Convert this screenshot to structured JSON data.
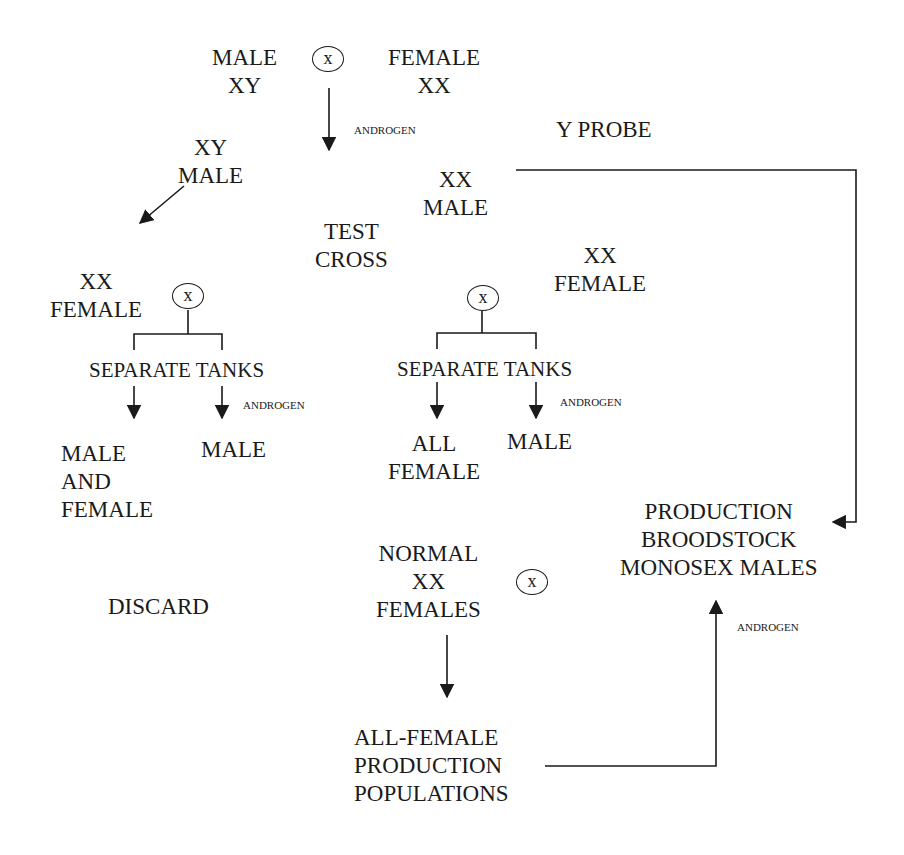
{
  "diagram": {
    "type": "flowchart",
    "nodes": {
      "parent_male": {
        "lines": [
          "MALE",
          "XY"
        ]
      },
      "parent_female": {
        "lines": [
          "FEMALE",
          "XX"
        ]
      },
      "offspring_xy_male": {
        "lines": [
          "XY",
          "MALE"
        ]
      },
      "offspring_xx_male": {
        "lines": [
          "XX",
          "MALE"
        ]
      },
      "test_cross": {
        "lines": [
          "TEST",
          "CROSS"
        ]
      },
      "left_xx_female": {
        "lines": [
          "XX",
          "FEMALE"
        ]
      },
      "mid_xx_female": {
        "lines": [
          "XX",
          "FEMALE"
        ]
      },
      "left_separate_tanks": {
        "text": "SEPARATE TANKS"
      },
      "mid_separate_tanks": {
        "text": "SEPARATE TANKS"
      },
      "left_result_mixed": {
        "lines": [
          "MALE",
          "AND",
          "FEMALE"
        ]
      },
      "left_result_male": {
        "text": "MALE"
      },
      "mid_result_all_female": {
        "lines": [
          "ALL",
          "FEMALE"
        ]
      },
      "mid_result_male": {
        "text": "MALE"
      },
      "discard": {
        "text": "DISCARD"
      },
      "normal_xx_females": {
        "lines": [
          "NORMAL",
          "XX",
          "FEMALES"
        ]
      },
      "production_broodstock": {
        "lines": [
          "PRODUCTION",
          "BROODSTOCK",
          "MONOSEX  MALES"
        ]
      },
      "all_female_production": {
        "lines": [
          "ALL-FEMALE",
          "PRODUCTION",
          "POPULATIONS"
        ]
      }
    },
    "edge_labels": {
      "androgen_top": "ANDROGEN",
      "androgen_left": "ANDROGEN",
      "androgen_mid": "ANDROGEN",
      "androgen_bottom": "ANDROGEN",
      "y_probe": "Y PROBE"
    },
    "cross_symbol": "x",
    "edges": [
      {
        "from": "parent cross",
        "to": "offspring",
        "label": "ANDROGEN"
      },
      {
        "from": "XY MALE",
        "to": "left test cross"
      },
      {
        "from": "XX MALE",
        "to": "PRODUCTION BROODSTOCK MONOSEX MALES",
        "label": "Y PROBE"
      },
      {
        "from": "left cross",
        "to": "MALE AND FEMALE"
      },
      {
        "from": "left cross",
        "to": "MALE",
        "label": "ANDROGEN"
      },
      {
        "from": "middle cross",
        "to": "ALL FEMALE"
      },
      {
        "from": "middle cross",
        "to": "MALE",
        "label": "ANDROGEN"
      },
      {
        "from": "NORMAL XX FEMALES cross",
        "to": "ALL-FEMALE PRODUCTION POPULATIONS"
      },
      {
        "from": "ALL-FEMALE PRODUCTION POPULATIONS",
        "to": "PRODUCTION BROODSTOCK MONOSEX MALES",
        "label": "ANDROGEN"
      }
    ],
    "colors": {
      "ink": "#1a1a1a",
      "background": "#ffffff"
    }
  }
}
